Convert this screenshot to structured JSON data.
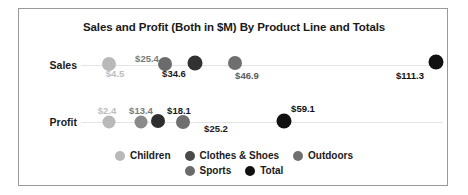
{
  "chart_data": {
    "type": "scatter",
    "title": "Sales and Profit (Both in $M) By Product Line and Totals",
    "xlabel": "",
    "ylabel": "",
    "categories": [
      "Sales",
      "Profit"
    ],
    "grid": true,
    "legend_position": "bottom",
    "legend": [
      {
        "name": "Children",
        "color": "#b9b9b9"
      },
      {
        "name": "Clothes & Shoes",
        "color": "#4a4a4a"
      },
      {
        "name": "Outdoors",
        "color": "#6f6f6f"
      },
      {
        "name": "Sports",
        "color": "#6b6b6b"
      },
      {
        "name": "Total",
        "color": "#111111"
      }
    ],
    "xlim": [
      0,
      120
    ],
    "series": [
      {
        "name": "Sales",
        "points": [
          {
            "series": "Children",
            "value": 4.5,
            "label": "$4.5",
            "color": "#b9b9b9"
          },
          {
            "series": "Sports",
            "value": 25.4,
            "label": "$25.4",
            "color": "#6b6b6b"
          },
          {
            "series": "Clothes & Shoes",
            "value": 34.6,
            "label": "$34.6",
            "color": "#3a3a3a"
          },
          {
            "series": "Outdoors",
            "value": 46.9,
            "label": "$46.9",
            "color": "#6f6f6f"
          },
          {
            "series": "Total",
            "value": 111.3,
            "label": "$111.3",
            "color": "#111111"
          }
        ]
      },
      {
        "name": "Profit",
        "points": [
          {
            "series": "Children",
            "value": 2.4,
            "label": "$2.4",
            "color": "#b9b9b9"
          },
          {
            "series": "Sports",
            "value": 13.4,
            "label": "$13.4",
            "color": "#858585"
          },
          {
            "series": "Clothes & Shoes",
            "value": 18.1,
            "label": "$18.1",
            "color": "#3a3a3a"
          },
          {
            "series": "Outdoors",
            "value": 25.2,
            "label": "$25.2",
            "color": "#6f6f6f"
          },
          {
            "series": "Total",
            "value": 59.1,
            "label": "$59.1",
            "color": "#111111"
          }
        ]
      }
    ]
  },
  "rows": [
    {
      "label": "Sales",
      "label_x": 2,
      "label_y": 50,
      "axis_y": 56,
      "dots": [
        {
          "name": "dot-sales-children",
          "x": 90,
          "y": 55,
          "r": 7,
          "color": "#b9b9b9"
        },
        {
          "name": "dot-sales-sports",
          "x": 146,
          "y": 55,
          "r": 7,
          "color": "#6b6b6b"
        },
        {
          "name": "dot-sales-clothes",
          "x": 176,
          "y": 54,
          "r": 7.5,
          "color": "#323232"
        },
        {
          "name": "dot-sales-outdoors",
          "x": 216,
          "y": 54,
          "r": 7,
          "color": "#6f6f6f"
        },
        {
          "name": "dot-sales-total",
          "x": 417,
          "y": 53,
          "r": 7.5,
          "color": "#111111"
        }
      ],
      "values": [
        {
          "name": "value-sales-children",
          "text": "$4.5",
          "x": 96,
          "y": 59,
          "color": "#bdbdbd"
        },
        {
          "name": "value-sales-sports",
          "text": "$25.4",
          "x": 128,
          "y": 44,
          "color": "#7a7a7a"
        },
        {
          "name": "value-sales-clothes",
          "text": "$34.6",
          "x": 155,
          "y": 59,
          "color": "#1a1a1a"
        },
        {
          "name": "value-sales-outdoors",
          "text": "$46.9",
          "x": 228,
          "y": 61,
          "color": "#5c5c5c"
        },
        {
          "name": "value-sales-total",
          "text": "$111.3",
          "x": 391,
          "y": 61,
          "color": "#111111"
        }
      ]
    },
    {
      "label": "Profit",
      "label_x": 2,
      "label_y": 107,
      "axis_y": 113,
      "dots": [
        {
          "name": "dot-profit-children",
          "x": 90,
          "y": 113,
          "r": 6.5,
          "color": "#b9b9b9"
        },
        {
          "name": "dot-profit-sports",
          "x": 122,
          "y": 113,
          "r": 6.5,
          "color": "#8a8a8a"
        },
        {
          "name": "dot-profit-clothes",
          "x": 139,
          "y": 112,
          "r": 7,
          "color": "#2e2e2e"
        },
        {
          "name": "dot-profit-outdoors",
          "x": 164,
          "y": 113,
          "r": 7,
          "color": "#6f6f6f"
        },
        {
          "name": "dot-profit-total",
          "x": 265,
          "y": 112,
          "r": 7.5,
          "color": "#111111"
        }
      ],
      "values": [
        {
          "name": "value-profit-children",
          "text": "$2.4",
          "x": 88,
          "y": 96,
          "color": "#bdbdbd"
        },
        {
          "name": "value-profit-sports",
          "text": "$13.4",
          "x": 122,
          "y": 96,
          "color": "#7a7a7a"
        },
        {
          "name": "value-profit-clothes",
          "text": "$18.1",
          "x": 160,
          "y": 96,
          "color": "#1a1a1a"
        },
        {
          "name": "value-profit-outdoors",
          "text": "$25.2",
          "x": 197,
          "y": 114,
          "color": "#1a1a1a"
        },
        {
          "name": "value-profit-total",
          "text": "$59.1",
          "x": 284,
          "y": 94,
          "color": "#111111"
        }
      ]
    }
  ],
  "legend": {
    "row1": [
      {
        "label": "Children",
        "color": "#b9b9b9"
      },
      {
        "label": "Clothes & Shoes",
        "color": "#4a4a4a"
      },
      {
        "label": "Outdoors",
        "color": "#6f6f6f"
      }
    ],
    "row2": [
      {
        "label": "Sports",
        "color": "#6b6b6b"
      },
      {
        "label": "Total",
        "color": "#111111"
      }
    ]
  }
}
